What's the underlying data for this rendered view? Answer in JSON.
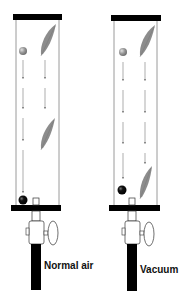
{
  "figure": {
    "colors": {
      "background": "#ffffff",
      "cap": "#000000",
      "tube_wall": "#9a9a9a",
      "arrow": "#8a8a8a",
      "feather": "#8c8c8c",
      "ball_top": "#8e8e8e",
      "ball_bottom": "#000000",
      "pipe": "#000000",
      "valve_outline": "#333333"
    },
    "tubes": [
      {
        "id": "normal-air",
        "label": "Normal air",
        "description": "Ball falls faster than feather; feather lags behind due to air resistance"
      },
      {
        "id": "vacuum",
        "label": "Vacuum",
        "description": "Ball and feather fall at the same rate"
      }
    ]
  }
}
